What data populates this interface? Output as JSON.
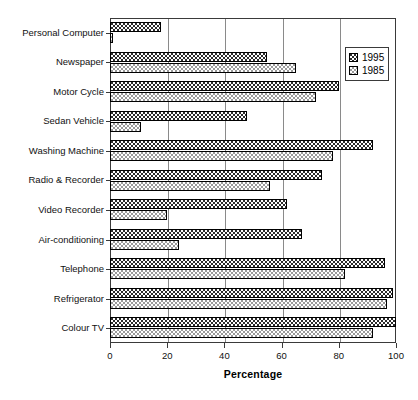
{
  "chart_data": {
    "type": "bar",
    "orientation": "horizontal",
    "title": "",
    "xlabel": "Percentage",
    "ylabel": "",
    "xlim": [
      0,
      100
    ],
    "xticks": [
      0,
      20,
      40,
      60,
      80,
      100
    ],
    "grid": true,
    "legend_position": "top-right",
    "categories": [
      "Personal Computer",
      "Newspaper",
      "Motor Cycle",
      "Sedan Vehicle",
      "Washing Machine",
      "Radio & Recorder",
      "Video Recorder",
      "Air-conditioning",
      "Telephone",
      "Refrigerator",
      "Colour TV"
    ],
    "series": [
      {
        "name": "1995",
        "fill": "dark-checkerboard",
        "color": "#2b2b2b",
        "values": [
          18,
          55,
          80,
          48,
          92,
          74,
          62,
          67,
          96,
          99,
          100
        ]
      },
      {
        "name": "1985",
        "fill": "light-dotted",
        "color": "#ffffff",
        "values": [
          1,
          65,
          72,
          11,
          78,
          56,
          20,
          24,
          82,
          97,
          92
        ]
      }
    ]
  },
  "legend": {
    "entries": [
      {
        "label": "1995"
      },
      {
        "label": "1985"
      }
    ]
  }
}
